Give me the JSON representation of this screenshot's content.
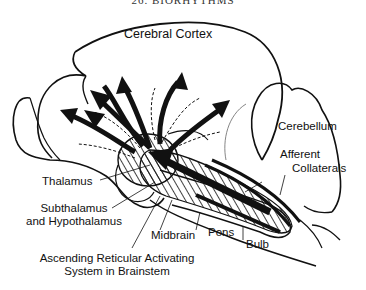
{
  "header": {
    "text": "26. BIORHYTHMS"
  },
  "diagram": {
    "title": "Ascending Reticular Activating System in Brainstem",
    "labels": {
      "cerebral_cortex": "Cerebral Cortex",
      "cerebellum": "Cerebellum",
      "afferent": "Afferent",
      "collaterals": "Collaterals",
      "thalamus": "Thalamus",
      "subthalamus": "Subthalamus",
      "hypothalamus": "and Hypothalamus",
      "midbrain": "Midbrain",
      "pons": "Pons",
      "bulb": "Bulb",
      "aras_line1": "Ascending Reticular Activating",
      "aras_line2": "System in Brainstem"
    }
  }
}
